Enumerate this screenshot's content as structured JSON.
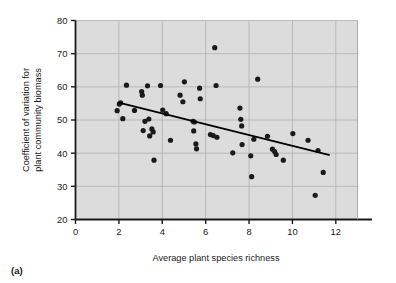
{
  "figure": {
    "panel_caption": "(a)",
    "background_color": "#ffffff",
    "plot_area_color": "#dcdcdc",
    "grid_color": "#b0b0b0",
    "axis_color": "#1a1a1a",
    "point_color": "#1a1a1a",
    "trendline_color": "#000000"
  },
  "chart_data": {
    "type": "scatter",
    "title": "",
    "xlabel": "Average plant species richness",
    "ylabel": "Coefficient of variation for plant community biomass",
    "ylabel_line1": "Coefficient of variation for",
    "ylabel_line2": "plant community biomass",
    "xlim": [
      0,
      13
    ],
    "ylim": [
      20,
      80
    ],
    "xticks": [
      0,
      2,
      4,
      6,
      8,
      10,
      12
    ],
    "xtick_labels": [
      "0",
      "2",
      "4",
      "6",
      "8",
      "10",
      "12"
    ],
    "yticks": [
      20,
      30,
      40,
      50,
      60,
      70,
      80
    ],
    "ytick_labels": [
      "20",
      "30",
      "40",
      "50",
      "60",
      "70",
      "80"
    ],
    "grid": true,
    "grid_axes": "both",
    "legend": "none",
    "point_marker": "filled-circle",
    "point_radius": 2.6,
    "points": [
      {
        "x": 1.92,
        "y": 52.8
      },
      {
        "x": 2.02,
        "y": 54.8
      },
      {
        "x": 2.08,
        "y": 55.2
      },
      {
        "x": 2.18,
        "y": 50.4
      },
      {
        "x": 2.35,
        "y": 60.5
      },
      {
        "x": 2.72,
        "y": 52.9
      },
      {
        "x": 3.05,
        "y": 58.6
      },
      {
        "x": 3.08,
        "y": 57.5
      },
      {
        "x": 3.12,
        "y": 46.8
      },
      {
        "x": 3.2,
        "y": 49.6
      },
      {
        "x": 3.32,
        "y": 60.3
      },
      {
        "x": 3.38,
        "y": 50.3
      },
      {
        "x": 3.42,
        "y": 45.2
      },
      {
        "x": 3.52,
        "y": 47.3
      },
      {
        "x": 3.58,
        "y": 46.4
      },
      {
        "x": 3.62,
        "y": 37.9
      },
      {
        "x": 3.92,
        "y": 60.4
      },
      {
        "x": 4.02,
        "y": 53.0
      },
      {
        "x": 4.18,
        "y": 51.9
      },
      {
        "x": 4.38,
        "y": 43.9
      },
      {
        "x": 4.82,
        "y": 57.5
      },
      {
        "x": 4.95,
        "y": 55.5
      },
      {
        "x": 5.02,
        "y": 61.5
      },
      {
        "x": 5.42,
        "y": 49.6
      },
      {
        "x": 5.48,
        "y": 49.4
      },
      {
        "x": 5.45,
        "y": 46.7
      },
      {
        "x": 5.55,
        "y": 42.8
      },
      {
        "x": 5.58,
        "y": 41.3
      },
      {
        "x": 5.72,
        "y": 59.6
      },
      {
        "x": 5.75,
        "y": 56.4
      },
      {
        "x": 6.22,
        "y": 45.6
      },
      {
        "x": 6.35,
        "y": 45.3
      },
      {
        "x": 6.42,
        "y": 71.8
      },
      {
        "x": 6.48,
        "y": 60.4
      },
      {
        "x": 6.52,
        "y": 44.8
      },
      {
        "x": 7.25,
        "y": 40.1
      },
      {
        "x": 7.58,
        "y": 53.6
      },
      {
        "x": 7.62,
        "y": 50.2
      },
      {
        "x": 7.66,
        "y": 48.2
      },
      {
        "x": 7.68,
        "y": 42.6
      },
      {
        "x": 8.08,
        "y": 39.2
      },
      {
        "x": 8.12,
        "y": 32.9
      },
      {
        "x": 8.22,
        "y": 44.2
      },
      {
        "x": 8.4,
        "y": 62.3
      },
      {
        "x": 8.85,
        "y": 45.1
      },
      {
        "x": 9.08,
        "y": 41.2
      },
      {
        "x": 9.18,
        "y": 40.5
      },
      {
        "x": 9.25,
        "y": 39.6
      },
      {
        "x": 9.58,
        "y": 37.9
      },
      {
        "x": 10.02,
        "y": 45.9
      },
      {
        "x": 10.72,
        "y": 43.9
      },
      {
        "x": 11.05,
        "y": 27.3
      },
      {
        "x": 11.18,
        "y": 40.8
      },
      {
        "x": 11.42,
        "y": 34.2
      }
    ],
    "trendline": {
      "type": "linear-fit",
      "x_start": 1.95,
      "y_start": 55.3,
      "x_end": 11.72,
      "y_end": 39.4
    }
  }
}
